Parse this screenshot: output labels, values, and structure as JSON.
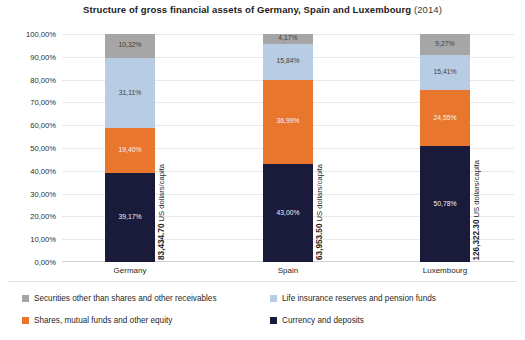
{
  "chart_data": {
    "type": "bar",
    "subtype": "stacked-percent-column",
    "title": "Structure of gross financial assets of Germany, Spain and Luxembourg",
    "title_year": "(2014)",
    "xlabel": "",
    "ylabel": "",
    "ylim": [
      0,
      100
    ],
    "grid": true,
    "legend_position": "bottom",
    "categories": [
      "Germany",
      "Spain",
      "Luxembourg"
    ],
    "ytick_labels": [
      "100,00%",
      "90,00%",
      "80,00%",
      "70,00%",
      "60,00%",
      "50,00%",
      "40,00%",
      "30,00%",
      "20,00%",
      "10,00%",
      "0,00%"
    ],
    "ytick_values": [
      100,
      90,
      80,
      70,
      60,
      50,
      40,
      30,
      20,
      10,
      0
    ],
    "series": [
      {
        "name": "Securities other than shares and other receivables",
        "color": "#a6a6a6",
        "values": [
          10.32,
          4.17,
          9.27
        ],
        "labels": [
          "10,32%",
          "4,17%",
          "9,27%"
        ]
      },
      {
        "name": "Life insurance reserves and pension funds",
        "color": "#b8cce4",
        "values": [
          31.11,
          15.84,
          15.41
        ],
        "labels": [
          "31,11%",
          "15,84%",
          "15,41%"
        ]
      },
      {
        "name": "Shares, mutual funds and other equity",
        "color": "#e8762c",
        "values": [
          19.4,
          36.99,
          24.55
        ],
        "labels": [
          "19,40%",
          "36,99%",
          "24,55%"
        ]
      },
      {
        "name": "Currency and deposits",
        "color": "#1a1a3a",
        "values": [
          39.17,
          43.0,
          50.78
        ],
        "labels": [
          "39,17%",
          "43,00%",
          "50,78%"
        ]
      }
    ],
    "annotations": [
      {
        "category": "Germany",
        "amount": "83,434.70",
        "unit": "US dollars/capita"
      },
      {
        "category": "Spain",
        "amount": "63,953.50",
        "unit": "US dollars/capita"
      },
      {
        "category": "Luxembourg",
        "amount": "126,322.30",
        "unit": "US dollars/capita"
      }
    ]
  },
  "legend": {
    "items": [
      {
        "label": "Securities other than shares and other receivables",
        "color": "#a6a6a6"
      },
      {
        "label": "Life insurance reserves and pension funds",
        "color": "#b8cce4"
      },
      {
        "label": "Shares, mutual funds and other equity",
        "color": "#e8762c"
      },
      {
        "label": "Currency and deposits",
        "color": "#1a1a3a"
      }
    ]
  },
  "colors": {
    "securities": "#a6a6a6",
    "life_insurance": "#b8cce4",
    "shares": "#e8762c",
    "currency": "#1a1a3a",
    "gridline": "#e8e8e8",
    "background": "#ffffff"
  }
}
